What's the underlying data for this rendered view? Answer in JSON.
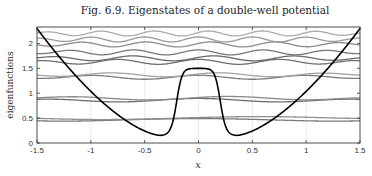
{
  "chart_data": {
    "type": "line",
    "title": "Fig. 6.9.  Eigenstates of a double-well potential",
    "xlabel": "x",
    "ylabel": "eigenfunctions",
    "xlim": [
      -1.5,
      1.5
    ],
    "ylim": [
      0,
      2.33
    ],
    "xticks": [
      -1.5,
      -1,
      -0.5,
      0,
      0.5,
      1,
      1.5
    ],
    "xtick_labels": [
      "-1.5",
      "-1",
      "-0.5",
      "0",
      "0.5",
      "1",
      "1.5"
    ],
    "yticks": [
      0,
      0.5,
      1,
      1.5,
      2
    ],
    "ytick_labels": [
      "0",
      "0.5",
      "1",
      "1.5",
      "2"
    ],
    "grid": "vertical",
    "potential": {
      "name": "double-well potential",
      "color": "#000000",
      "description": "parabolic outer walls, wells at x=±0.35 with minimum ≈0.15, central barrier plateau ≈1.5 for |x|<0.1",
      "well_centers": [
        -0.35,
        0.35
      ],
      "well_min": 0.15,
      "barrier_height": 1.5,
      "edge_value": 2.3
    },
    "eigenstates": [
      {
        "name": "state-1",
        "level": 0.46,
        "amplitude": 0.03,
        "waves": 1,
        "parity": "even",
        "color": "#7a7a7a"
      },
      {
        "name": "state-2",
        "level": 0.5,
        "amplitude": 0.03,
        "waves": 1,
        "parity": "odd",
        "color": "#8f8f8f"
      },
      {
        "name": "state-3",
        "level": 0.86,
        "amplitude": 0.035,
        "waves": 2,
        "parity": "even",
        "color": "#6e6e6e"
      },
      {
        "name": "state-4",
        "level": 0.9,
        "amplitude": 0.035,
        "waves": 2,
        "parity": "odd",
        "color": "#8a8a8a"
      },
      {
        "name": "state-5",
        "level": 1.32,
        "amplitude": 0.04,
        "waves": 3,
        "parity": "even",
        "color": "#7d7d7d"
      },
      {
        "name": "state-6",
        "level": 1.37,
        "amplitude": 0.04,
        "waves": 3,
        "parity": "odd",
        "color": "#a3a3a3"
      },
      {
        "name": "state-7",
        "level": 1.63,
        "amplitude": 0.05,
        "waves": 4,
        "parity": "even",
        "color": "#707070"
      },
      {
        "name": "state-8",
        "level": 1.7,
        "amplitude": 0.05,
        "waves": 4,
        "parity": "odd",
        "color": "#6a6a6a"
      },
      {
        "name": "state-9",
        "level": 1.82,
        "amplitude": 0.05,
        "waves": 5,
        "parity": "even",
        "color": "#777777"
      },
      {
        "name": "state-10",
        "level": 1.98,
        "amplitude": 0.05,
        "waves": 5,
        "parity": "odd",
        "color": "#8c8c8c"
      },
      {
        "name": "state-11",
        "level": 2.08,
        "amplitude": 0.05,
        "waves": 6,
        "parity": "even",
        "color": "#9a9a9a"
      },
      {
        "name": "state-12",
        "level": 2.2,
        "amplitude": 0.05,
        "waves": 6,
        "parity": "odd",
        "color": "#ababab"
      }
    ]
  }
}
